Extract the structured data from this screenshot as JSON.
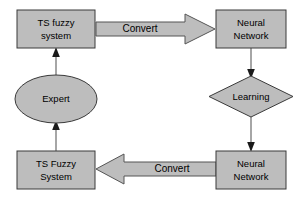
{
  "diagram": {
    "background_color": "#ffffff",
    "shape_fill_color": "#bdbdbd",
    "shape_border_color": "#3a3a3a",
    "arrow_fill_color": "#bdbdbd",
    "connector_color": "#6b6b6b",
    "text_color": "#000000",
    "nodes": [
      {
        "id": "ts-fuzzy-system-top",
        "shape": "rectangle",
        "line1": "TS fuzzy",
        "line2": "system"
      },
      {
        "id": "neural-network-top",
        "shape": "rectangle",
        "line1": "Neural",
        "line2": "Network"
      },
      {
        "id": "expert",
        "shape": "ellipse",
        "line1": "Expert",
        "line2": ""
      },
      {
        "id": "learning",
        "shape": "diamond",
        "line1": "Learning",
        "line2": ""
      },
      {
        "id": "ts-fuzzy-system-bottom",
        "shape": "rectangle",
        "line1": "TS Fuzzy",
        "line2": "System"
      },
      {
        "id": "neural-network-bottom",
        "shape": "rectangle",
        "line1": "Neural",
        "line2": "Network"
      }
    ],
    "edges": [
      {
        "id": "convert-top",
        "label": "Convert",
        "from": "ts-fuzzy-system-top",
        "to": "neural-network-top",
        "style": "block-arrow",
        "direction": "right"
      },
      {
        "id": "convert-bottom",
        "label": "Convert",
        "from": "neural-network-bottom",
        "to": "ts-fuzzy-system-bottom",
        "style": "block-arrow",
        "direction": "left"
      },
      {
        "id": "nn-to-learning",
        "label": "",
        "from": "neural-network-top",
        "to": "learning",
        "style": "line-arrow",
        "direction": "down"
      },
      {
        "id": "learning-to-nn",
        "label": "",
        "from": "learning",
        "to": "neural-network-bottom",
        "style": "line-arrow",
        "direction": "down"
      },
      {
        "id": "ts-bottom-to-expert",
        "label": "",
        "from": "ts-fuzzy-system-bottom",
        "to": "expert",
        "style": "line-arrow",
        "direction": "up"
      },
      {
        "id": "expert-to-ts-top",
        "label": "",
        "from": "expert",
        "to": "ts-fuzzy-system-top",
        "style": "line-arrow",
        "direction": "up"
      }
    ]
  }
}
